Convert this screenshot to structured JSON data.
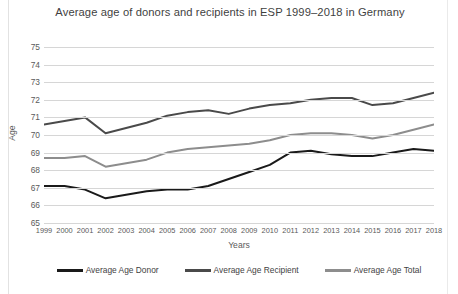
{
  "chart_data": {
    "type": "line",
    "title": "Average age of donors and recipients in ESP 1999–2018 in Germany",
    "xlabel": "Years",
    "ylabel": "Age",
    "ylim": [
      65,
      75
    ],
    "yticks": [
      75,
      74,
      73,
      72,
      71,
      70,
      69,
      68,
      67,
      66,
      65
    ],
    "grid": true,
    "legend_position": "bottom",
    "categories": [
      "1999",
      "2000",
      "2001",
      "2002",
      "2003",
      "2004",
      "2005",
      "2006",
      "2007",
      "2008",
      "2009",
      "2010",
      "2011",
      "2012",
      "2013",
      "2014",
      "2015",
      "2016",
      "2017",
      "2018"
    ],
    "series": [
      {
        "name": "Average Age Donor",
        "color": "#1a1a1a",
        "values": [
          67.1,
          67.1,
          66.9,
          66.4,
          66.6,
          66.8,
          66.9,
          66.9,
          67.1,
          67.5,
          67.9,
          68.3,
          69.0,
          69.1,
          68.9,
          68.8,
          68.8,
          69.0,
          69.2,
          69.1
        ]
      },
      {
        "name": "Average Age Recipient",
        "color": "#4a4a4a",
        "values": [
          70.6,
          70.8,
          71.0,
          70.1,
          70.4,
          70.7,
          71.1,
          71.3,
          71.4,
          71.2,
          71.5,
          71.7,
          71.8,
          72.0,
          72.1,
          72.1,
          71.7,
          71.8,
          72.1,
          72.4
        ]
      },
      {
        "name": "Average Age Total",
        "color": "#8d8d8d",
        "values": [
          68.7,
          68.7,
          68.8,
          68.2,
          68.4,
          68.6,
          69.0,
          69.2,
          69.3,
          69.4,
          69.5,
          69.7,
          70.0,
          70.1,
          70.1,
          70.0,
          69.8,
          70.0,
          70.3,
          70.6
        ]
      }
    ]
  },
  "legend": {
    "items": [
      {
        "label": "Average Age Donor"
      },
      {
        "label": "Average Age Recipient"
      },
      {
        "label": "Average Age Total"
      }
    ]
  }
}
